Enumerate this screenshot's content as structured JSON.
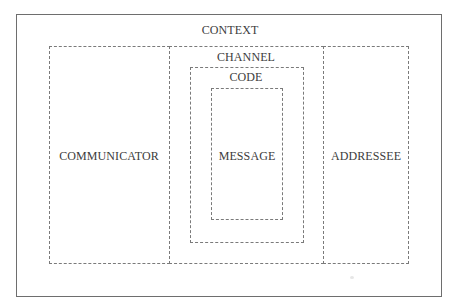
{
  "diagram": {
    "frame": {
      "style": "solid"
    },
    "labels": {
      "context": "CONTEXT",
      "channel": "CHANNEL",
      "code": "CODE",
      "message": "MESSAGE",
      "communicator": "COMMUNICATOR",
      "addressee": "ADDRESSEE"
    },
    "nesting": [
      {
        "box": "context",
        "contains": [
          "communicator",
          "channel",
          "addressee"
        ]
      },
      {
        "box": "channel",
        "contains": [
          "code"
        ]
      },
      {
        "box": "code",
        "contains": [
          "message"
        ]
      }
    ],
    "colors": {
      "frame_border": "#6e6e6e",
      "dashed_border": "#7a7a7a",
      "text": "#3c3c3c",
      "background": "#ffffff"
    }
  }
}
